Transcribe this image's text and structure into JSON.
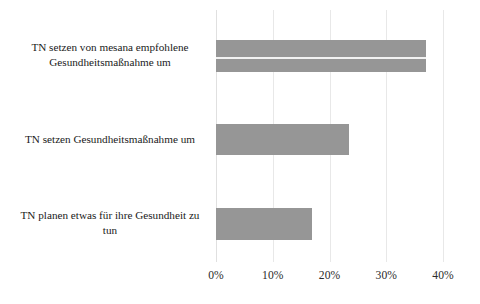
{
  "chart_data": {
    "type": "bar",
    "orientation": "horizontal",
    "title": "",
    "subtitle": "",
    "xlabel": "",
    "ylabel": "",
    "xlim": [
      0,
      40
    ],
    "xticks": [
      0,
      10,
      20,
      30,
      40
    ],
    "xtick_labels": [
      "0%",
      "10%",
      "20%",
      "30%",
      "40%"
    ],
    "grid": "vertical",
    "legend": "none",
    "value_unit": "%",
    "bar_color": "#969696",
    "gridline_color": "#e8e8e8",
    "categories": [
      "TN setzen von mesana empfohlene Gesundheitsmaßnahme um",
      "TN setzen Gesundheitsmaßnahme um",
      "TN planen etwas für ihre Gesundheit zu tun"
    ],
    "category_lines": [
      [
        "TN setzen von mesana empfohlene",
        "Gesundheitsmaßnahme um"
      ],
      [
        "TN setzen Gesundheitsmaßnahme um"
      ],
      [
        "TN planen etwas für ihre Gesundheit zu",
        "tun"
      ]
    ],
    "values": [
      37,
      23.5,
      17
    ],
    "series": [
      {
        "name": "Anteil",
        "values": [
          37,
          23.5,
          17
        ]
      }
    ]
  }
}
